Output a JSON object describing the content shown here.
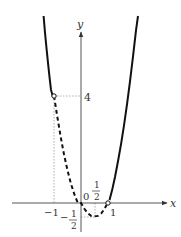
{
  "figure": {
    "function": "y = 2x^2 - 2x",
    "axes": {
      "x_label": "x",
      "y_label": "y",
      "origin_label": "0"
    },
    "labels": {
      "y_four": "4",
      "x_neg_one": "−1",
      "x_one": "1",
      "x_half_num": "1",
      "x_half_den": "2",
      "y_neg_half_sign": "−",
      "y_neg_half_num": "1",
      "y_neg_half_den": "2"
    },
    "points": {
      "open_left": {
        "x": -1,
        "y": 4
      },
      "open_right": {
        "x": 1,
        "y": 0
      },
      "vertex": {
        "x": 0.5,
        "y": -0.5
      }
    },
    "segments": [
      {
        "range": "x < -1",
        "style": "solid"
      },
      {
        "range": "-1 < x < 1",
        "style": "dashed"
      },
      {
        "range": "x > 1",
        "style": "solid"
      }
    ],
    "colors": {
      "curve": "#111111",
      "axis": "#555555",
      "guide": "#999999"
    }
  }
}
